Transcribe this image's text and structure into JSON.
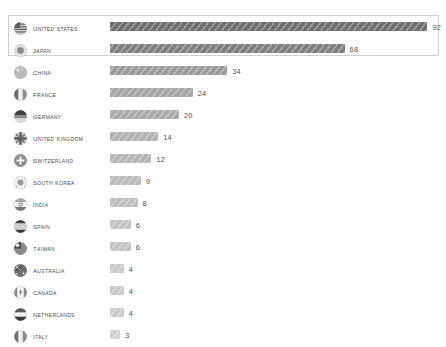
{
  "chart_title": "",
  "colors": {
    "background": "#ffffff",
    "text": "#4a4a4a",
    "value_text": "#4f4f4f",
    "box_border": "#cfcfcf",
    "bar_dark": "#6f6f6f",
    "bar_light": "#d2d2d2"
  },
  "layout": {
    "bar_origin_x": 110,
    "px_per_unit": 3.45,
    "row_height": 22,
    "first_row_top": 18,
    "highlight_rows": 2
  },
  "chart_data": {
    "type": "bar",
    "orientation": "horizontal",
    "title": "",
    "xlabel": "",
    "ylabel": "",
    "categories": [
      "United States",
      "Japan",
      "China",
      "France",
      "Germany",
      "United Kingdom",
      "Switzerland",
      "South Korea",
      "India",
      "Spain",
      "Taiwan",
      "Australia",
      "Canada",
      "Netherlands",
      "Italy"
    ],
    "values": [
      92,
      68,
      34,
      24,
      20,
      14,
      12,
      9,
      8,
      6,
      6,
      4,
      4,
      4,
      3
    ],
    "xlim": [
      0,
      92
    ],
    "grid": false,
    "legend": "none",
    "data_labels": true
  },
  "rows": [
    {
      "label": "United States",
      "value": 92,
      "value_text": "92",
      "icon": "flag-united-states-icon",
      "highlighted": true
    },
    {
      "label": "Japan",
      "value": 68,
      "value_text": "68",
      "icon": "flag-japan-icon",
      "highlighted": true
    },
    {
      "label": "China",
      "value": 34,
      "value_text": "34",
      "icon": "flag-china-icon",
      "highlighted": false
    },
    {
      "label": "France",
      "value": 24,
      "value_text": "24",
      "icon": "flag-france-icon",
      "highlighted": false
    },
    {
      "label": "Germany",
      "value": 20,
      "value_text": "20",
      "icon": "flag-germany-icon",
      "highlighted": false
    },
    {
      "label": "United Kingdom",
      "value": 14,
      "value_text": "14",
      "icon": "flag-united-kingdom-icon",
      "highlighted": false
    },
    {
      "label": "Switzerland",
      "value": 12,
      "value_text": "12",
      "icon": "flag-switzerland-icon",
      "highlighted": false
    },
    {
      "label": "South Korea",
      "value": 9,
      "value_text": "9",
      "icon": "flag-south-korea-icon",
      "highlighted": false
    },
    {
      "label": "India",
      "value": 8,
      "value_text": "8",
      "icon": "flag-india-icon",
      "highlighted": false
    },
    {
      "label": "Spain",
      "value": 6,
      "value_text": "6",
      "icon": "flag-spain-icon",
      "highlighted": false
    },
    {
      "label": "Taiwan",
      "value": 6,
      "value_text": "6",
      "icon": "flag-taiwan-icon",
      "highlighted": false
    },
    {
      "label": "Australia",
      "value": 4,
      "value_text": "4",
      "icon": "flag-australia-icon",
      "highlighted": false
    },
    {
      "label": "Canada",
      "value": 4,
      "value_text": "4",
      "icon": "flag-canada-icon",
      "highlighted": false
    },
    {
      "label": "Netherlands",
      "value": 4,
      "value_text": "4",
      "icon": "flag-netherlands-icon",
      "highlighted": false
    },
    {
      "label": "Italy",
      "value": 3,
      "value_text": "3",
      "icon": "flag-italy-icon",
      "highlighted": false
    }
  ]
}
